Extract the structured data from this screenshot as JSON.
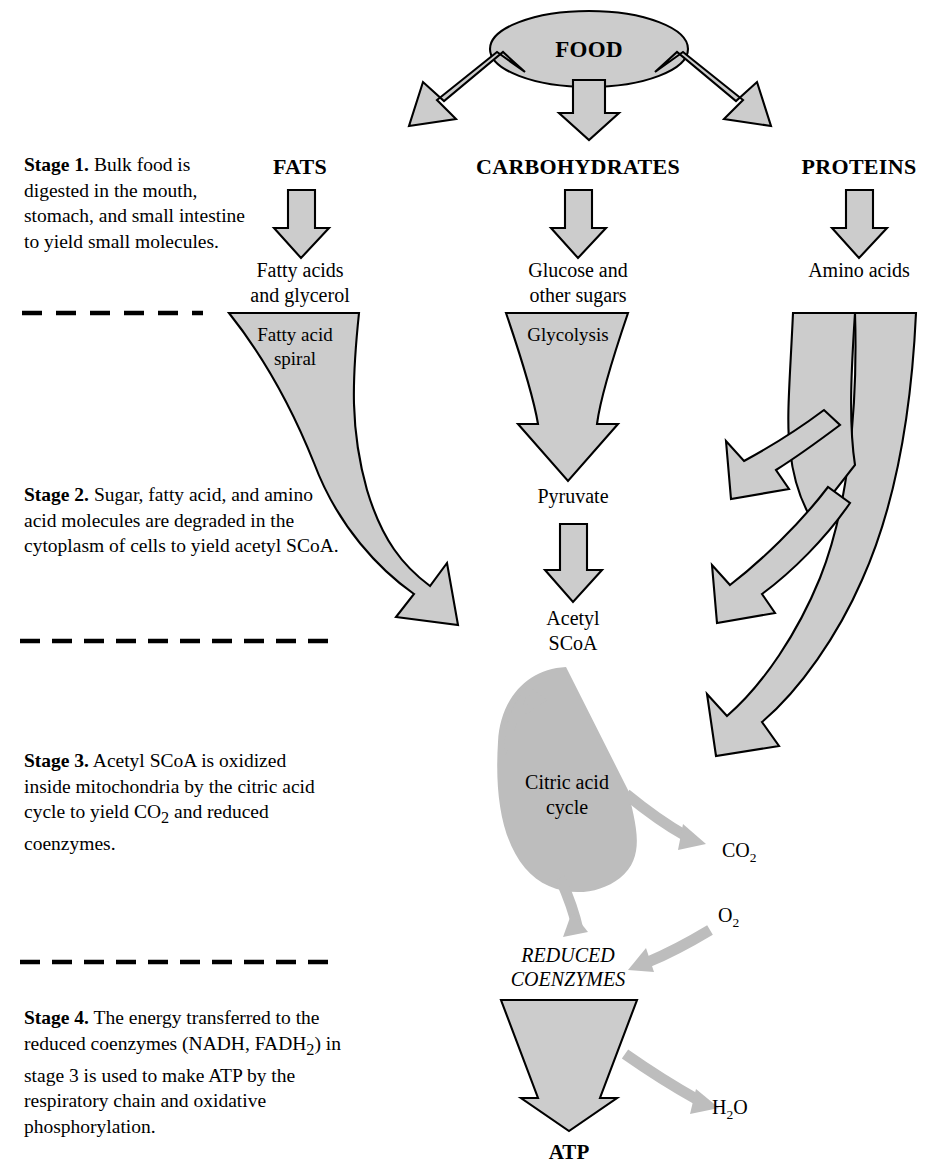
{
  "colors": {
    "block_fill": "#cccccc",
    "block_stroke": "#000000",
    "cycle_arrow": "#bdbdbd",
    "background": "#ffffff",
    "text": "#000000"
  },
  "stages": [
    {
      "id": "stage-1",
      "label": "Stage 1.",
      "text": "Bulk food is digested in the mouth, stomach, and small intestine to yield small molecules.",
      "lines": [
        "Bulk food",
        "is digested in the mouth,",
        "stomach, and small",
        "intestine to yield",
        "small molecules."
      ]
    },
    {
      "id": "stage-2",
      "label": "Stage 2.",
      "text": "Sugar, fatty acid, and amino acid molecules are degraded in the cytoplasm of cells to yield acetyl SCoA.",
      "lines": [
        "Sugar, fatty acid,",
        "and amino acid molecules are",
        "degraded in the cytoplasm of",
        "cells to yield acetyl SCoA."
      ]
    },
    {
      "id": "stage-3",
      "label": "Stage 3.",
      "text": "Acetyl SCoA is oxidized inside mitochondria by the citric acid cycle to yield CO2 and reduced coenzymes.",
      "lines": [
        "Acetyl SCoA is",
        "oxidized inside mitochondria",
        "by the citric acid cycle to",
        "yield CO2 and reduced",
        "coenzymes."
      ]
    },
    {
      "id": "stage-4",
      "label": "Stage 4.",
      "text": "The energy transferred to the reduced coenzymes (NADH, FADH2) in stage 3 is used to make ATP by the respiratory chain and oxidative phosphorylation.",
      "lines": [
        "The energy transferred",
        "to the reduced coenzymes (NADH,",
        "FADH2) in stage 3 is used to make",
        "ATP by the respiratory chain and",
        "oxidative phosphorylation."
      ]
    }
  ],
  "dividers": [
    {
      "id": "divider-1",
      "dashes": 6,
      "x1": 22,
      "x2": 203,
      "y": 313
    },
    {
      "id": "divider-2",
      "dashes": 10,
      "x1": 20,
      "x2": 332,
      "y": 641
    },
    {
      "id": "divider-3",
      "dashes": 10,
      "x1": 20,
      "x2": 332,
      "y": 962
    }
  ],
  "nodes": {
    "food": "FOOD",
    "fats": "FATS",
    "carbohydrates": "CARBOHYDRATES",
    "proteins": "PROTEINS",
    "fatty_acids_l1": "Fatty acids",
    "fatty_acids_l2": "and glycerol",
    "glucose_l1": "Glucose and",
    "glucose_l2": "other sugars",
    "amino_acids": "Amino acids",
    "fatty_acid_spiral_l1": "Fatty acid",
    "fatty_acid_spiral_l2": "spiral",
    "glycolysis": "Glycolysis",
    "amino_acid_catabolism_l1": "Amino acid",
    "amino_acid_catabolism_l2": "catabolism",
    "pyruvate": "Pyruvate",
    "acetyl_scoa_l1": "Acetyl",
    "acetyl_scoa_l2": "SCoA",
    "citric_acid_cycle_l1": "Citric acid",
    "citric_acid_cycle_l2": "cycle",
    "reduced_coenzymes_l1": "REDUCED",
    "reduced_coenzymes_l2": "COENZYMES",
    "atp": "ATP",
    "co2_base": "CO",
    "co2_sub": "2",
    "o2_base": "O",
    "o2_sub": "2",
    "h2o_base_a": "H",
    "h2o_sub": "2",
    "h2o_base_b": "O"
  }
}
